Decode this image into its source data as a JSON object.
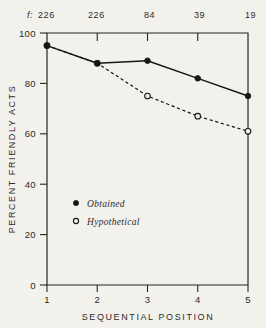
{
  "chart_data": {
    "type": "line",
    "title": "",
    "subtitle": "",
    "xlabel": "SEQUENTIAL POSITION",
    "ylabel": "PERCENT FRIENDLY ACTS",
    "x": [
      1,
      2,
      3,
      4,
      5
    ],
    "xtick_labels": [
      "1",
      "2",
      "3",
      "4",
      "5"
    ],
    "xlim": [
      1,
      5
    ],
    "ytick_labels": [
      "0",
      "20",
      "40",
      "60",
      "80",
      "100"
    ],
    "yticks": [
      0,
      20,
      40,
      60,
      80,
      100
    ],
    "ylim": [
      0,
      100
    ],
    "grid": false,
    "legend_position": "center-left",
    "series": [
      {
        "name": "Obtained",
        "marker": "filled-circle",
        "linestyle": "solid",
        "values": [
          95,
          88,
          89,
          82,
          75
        ]
      },
      {
        "name": "Hypothetical",
        "marker": "open-circle",
        "linestyle": "dashed",
        "values": [
          95,
          88,
          75,
          67,
          61
        ]
      }
    ],
    "secondary_axis": {
      "prefix": "f:",
      "position": "top",
      "values": [
        "226",
        "226",
        "84",
        "39",
        "19"
      ]
    },
    "colors": {
      "ink": "#161616",
      "axis": "#262626",
      "paper": "#f3f1ec"
    }
  }
}
